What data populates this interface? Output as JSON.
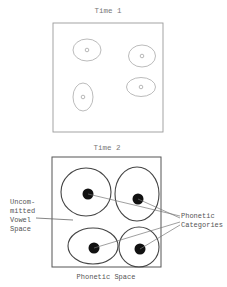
{
  "diagram": {
    "panels": [
      {
        "title": "Time 1",
        "box": {
          "x": 53,
          "y": 23,
          "w": 110,
          "h": 109
        },
        "stroke": "#9a9a9a",
        "regions": [
          {
            "cx": 87,
            "cy": 50,
            "rx": 14,
            "ry": 11,
            "dot_r": 1.8
          },
          {
            "cx": 142,
            "cy": 56,
            "rx": 13.5,
            "ry": 11,
            "dot_r": 1.8
          },
          {
            "cx": 83,
            "cy": 97,
            "rx": 10,
            "ry": 14,
            "dot_r": 1.8
          },
          {
            "cx": 141,
            "cy": 87,
            "rx": 14.5,
            "ry": 9.5,
            "dot_r": 1.8
          }
        ]
      },
      {
        "title": "Time 2",
        "box": {
          "x": 52,
          "y": 157,
          "w": 109,
          "h": 110
        },
        "stroke": "#555555",
        "regions": [
          {
            "cx": 86,
            "cy": 192,
            "rx": 25,
            "ry": 24,
            "dot": {
              "x": 88,
              "y": 194,
              "r": 5.5
            }
          },
          {
            "cx": 137,
            "cy": 194,
            "rx": 22,
            "ry": 27,
            "dot": {
              "x": 138,
              "y": 199,
              "r": 5.5
            }
          },
          {
            "cx": 93,
            "cy": 246,
            "rx": 25,
            "ry": 18,
            "dot": {
              "x": 94,
              "y": 248,
              "r": 5.5
            }
          },
          {
            "cx": 139,
            "cy": 247,
            "rx": 20,
            "ry": 20,
            "dot": {
              "x": 140,
              "y": 249,
              "r": 5.5
            }
          }
        ]
      }
    ],
    "labels": {
      "time1": "Time 1",
      "time2": "Time 2",
      "uncommitted": [
        "Uncom-",
        "mitted",
        "Vowel",
        "Space"
      ],
      "phonetic_categories": [
        "Phonetic",
        "Categories"
      ],
      "phonetic_space": "Phonetic Space"
    },
    "leader_lines": {
      "uncommitted": {
        "x1": 36,
        "y1": 218,
        "x2": 73,
        "y2": 220
      },
      "categories": [
        {
          "x1": 88,
          "y1": 194,
          "x2": 180,
          "y2": 216
        },
        {
          "x1": 138,
          "y1": 199,
          "x2": 180,
          "y2": 218
        },
        {
          "x1": 94,
          "y1": 248,
          "x2": 180,
          "y2": 222
        },
        {
          "x1": 140,
          "y1": 249,
          "x2": 180,
          "y2": 225
        }
      ]
    }
  }
}
